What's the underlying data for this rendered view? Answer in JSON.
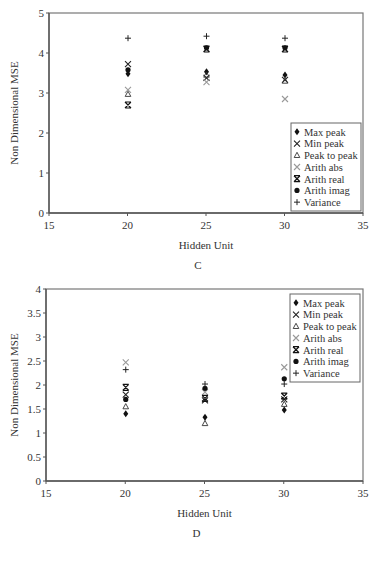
{
  "chart_data": [
    {
      "type": "scatter",
      "panel_label": "C",
      "title": "",
      "xlabel": "Hidden Unit",
      "ylabel": "Non Dimensional MSE",
      "xlim": [
        15,
        35
      ],
      "ylim": [
        0,
        5
      ],
      "xticks": [
        15,
        20,
        25,
        30,
        35
      ],
      "yticks": [
        0,
        1,
        2,
        3,
        4,
        5
      ],
      "grid": false,
      "legend_position": "lower right",
      "x": [
        20,
        25,
        30
      ],
      "series": [
        {
          "name": "Max peak",
          "marker": "diamond",
          "color": "#111111",
          "values": [
            3.48,
            3.53,
            3.45
          ]
        },
        {
          "name": "Min peak",
          "marker": "x",
          "color": "#222222",
          "values": [
            3.72,
            3.38,
            3.33
          ]
        },
        {
          "name": "Peak to peak",
          "marker": "triangle",
          "color": "#333333",
          "values": [
            2.97,
            3.45,
            3.3
          ]
        },
        {
          "name": "Arith abs",
          "marker": "x-light",
          "color": "#999999",
          "values": [
            3.08,
            3.27,
            2.85
          ]
        },
        {
          "name": "Arith real",
          "marker": "asterisk-x",
          "color": "#111111",
          "values": [
            2.7,
            4.1,
            4.1
          ]
        },
        {
          "name": "Arith imag",
          "marker": "circle",
          "color": "#111111",
          "values": [
            3.58,
            4.13,
            4.13
          ]
        },
        {
          "name": "Variance",
          "marker": "plus",
          "color": "#222222",
          "values": [
            4.37,
            4.42,
            4.37
          ]
        }
      ]
    },
    {
      "type": "scatter",
      "panel_label": "D",
      "title": "",
      "xlabel": "Hidden Unit",
      "ylabel": "Non Dimensional MSE",
      "xlim": [
        15,
        35
      ],
      "ylim": [
        0,
        4
      ],
      "xticks": [
        15,
        20,
        25,
        30,
        35
      ],
      "yticks": [
        0,
        0.5,
        1,
        1.5,
        2,
        2.5,
        3,
        3.5,
        4
      ],
      "grid": false,
      "legend_position": "upper right",
      "x": [
        20,
        25,
        30
      ],
      "series": [
        {
          "name": "Max peak",
          "marker": "diamond",
          "color": "#111111",
          "values": [
            1.4,
            1.33,
            1.48
          ]
        },
        {
          "name": "Min peak",
          "marker": "x",
          "color": "#222222",
          "values": [
            1.8,
            1.68,
            1.7
          ]
        },
        {
          "name": "Peak to peak",
          "marker": "triangle",
          "color": "#333333",
          "values": [
            1.55,
            1.2,
            1.6
          ]
        },
        {
          "name": "Arith abs",
          "marker": "x-light",
          "color": "#999999",
          "values": [
            2.47,
            1.85,
            2.37
          ]
        },
        {
          "name": "Arith real",
          "marker": "asterisk-x",
          "color": "#111111",
          "values": [
            1.95,
            1.72,
            1.77
          ]
        },
        {
          "name": "Arith imag",
          "marker": "circle",
          "color": "#111111",
          "values": [
            1.7,
            1.93,
            2.13
          ]
        },
        {
          "name": "Variance",
          "marker": "plus",
          "color": "#222222",
          "values": [
            2.32,
            2.02,
            2.02
          ]
        }
      ]
    }
  ]
}
